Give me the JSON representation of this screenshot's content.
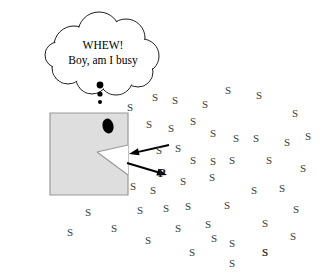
{
  "figure": {
    "canvas": {
      "width": 330,
      "height": 275,
      "background": "#ffffff"
    }
  },
  "thought_bubble": {
    "line1": "WHEW!",
    "line2": "Boy, am I busy",
    "outline_color": "#000000",
    "fill_color": "#ffffff",
    "tail_dots": [
      {
        "cx": 100,
        "cy": 85,
        "r": 3.4
      },
      {
        "cx": 100,
        "cy": 94,
        "r": 2.6
      },
      {
        "cx": 100,
        "cy": 102,
        "r": 2.0
      }
    ]
  },
  "enzyme": {
    "label": "enzyme-body",
    "fill_color": "#dedede",
    "stroke_color": "#9a9a9a",
    "body_points": "50,113 128,113 128,195 50,195",
    "notch_points": "128,145 97,152 128,175",
    "active_site_note": "wedge notch on right edge",
    "eye": {
      "fill_color": "#000000",
      "cx": 108,
      "cy": 126,
      "rx": 5.5,
      "ry": 7.5
    }
  },
  "arrows": {
    "stroke_color": "#000000",
    "inbound": {
      "name": "substrate-in-arrow",
      "x1": 169,
      "y1": 145,
      "x2": 129,
      "y2": 154
    },
    "outbound": {
      "name": "product-out-arrow",
      "x1": 127,
      "y1": 163,
      "x2": 167,
      "y2": 175
    }
  },
  "molecules": {
    "substrate_symbol": "S",
    "product_symbol": "P",
    "substrate_color": "#3a3a3a",
    "product_color": "#1a1a1a",
    "product": {
      "x": 162,
      "y": 173
    },
    "substrates": [
      {
        "x": 130,
        "y": 107
      },
      {
        "x": 155,
        "y": 97
      },
      {
        "x": 175,
        "y": 100
      },
      {
        "x": 205,
        "y": 104
      },
      {
        "x": 228,
        "y": 90
      },
      {
        "x": 259,
        "y": 95
      },
      {
        "x": 295,
        "y": 113
      },
      {
        "x": 149,
        "y": 124
      },
      {
        "x": 171,
        "y": 128
      },
      {
        "x": 193,
        "y": 121
      },
      {
        "x": 213,
        "y": 133
      },
      {
        "x": 236,
        "y": 138
      },
      {
        "x": 256,
        "y": 138
      },
      {
        "x": 287,
        "y": 142
      },
      {
        "x": 308,
        "y": 136
      },
      {
        "x": 159,
        "y": 150
      },
      {
        "x": 178,
        "y": 148
      },
      {
        "x": 193,
        "y": 160
      },
      {
        "x": 213,
        "y": 161
      },
      {
        "x": 232,
        "y": 160
      },
      {
        "x": 269,
        "y": 160
      },
      {
        "x": 303,
        "y": 168
      },
      {
        "x": 133,
        "y": 186
      },
      {
        "x": 153,
        "y": 190
      },
      {
        "x": 183,
        "y": 181
      },
      {
        "x": 212,
        "y": 177
      },
      {
        "x": 254,
        "y": 190
      },
      {
        "x": 282,
        "y": 188
      },
      {
        "x": 88,
        "y": 212
      },
      {
        "x": 140,
        "y": 210
      },
      {
        "x": 166,
        "y": 208
      },
      {
        "x": 188,
        "y": 206
      },
      {
        "x": 227,
        "y": 205
      },
      {
        "x": 296,
        "y": 209
      },
      {
        "x": 70,
        "y": 232
      },
      {
        "x": 114,
        "y": 228
      },
      {
        "x": 178,
        "y": 228
      },
      {
        "x": 208,
        "y": 224
      },
      {
        "x": 265,
        "y": 223
      },
      {
        "x": 148,
        "y": 240
      },
      {
        "x": 214,
        "y": 238
      },
      {
        "x": 293,
        "y": 236
      },
      {
        "x": 192,
        "y": 252
      },
      {
        "x": 232,
        "y": 243
      },
      {
        "x": 265,
        "y": 252
      },
      {
        "x": 265,
        "y": 252
      },
      {
        "x": 232,
        "y": 263
      }
    ]
  }
}
